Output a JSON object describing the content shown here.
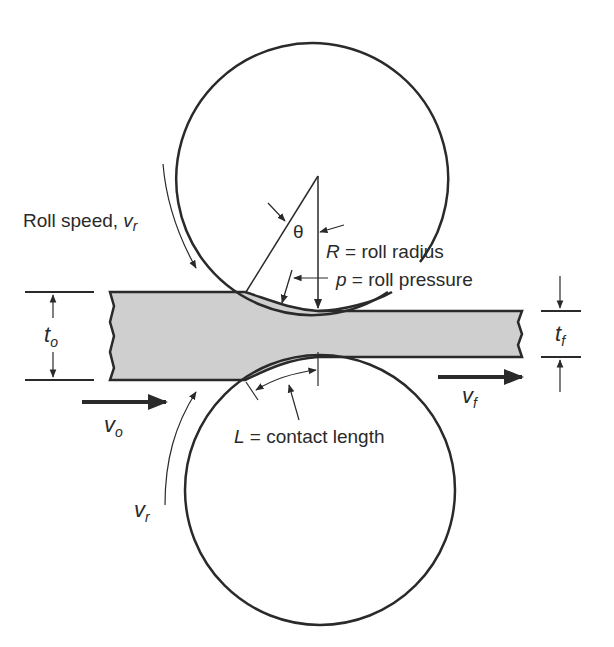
{
  "figure": {
    "colors": {
      "line": "#2a2a2a",
      "sheet_fill": "#cfcfcf",
      "background": "#ffffff"
    }
  },
  "labels": {
    "roll_speed_top": {
      "text": "Roll speed, ",
      "var": "v",
      "sub": "r"
    },
    "theta": {
      "text": "θ"
    },
    "roll_radius": {
      "var": "R",
      "text": " = roll radius"
    },
    "roll_pressure": {
      "var": "p",
      "text": " = roll pressure"
    },
    "entry_thickness": {
      "var": "t",
      "sub": "o"
    },
    "exit_thickness": {
      "var": "t",
      "sub": "f"
    },
    "entry_velocity": {
      "var": "v",
      "sub": "o"
    },
    "exit_velocity": {
      "var": "v",
      "sub": "f"
    },
    "contact_length": {
      "var": "L",
      "text": " = contact length"
    },
    "roll_speed_bottom": {
      "var": "v",
      "sub": "r"
    }
  },
  "geometry": {
    "top_roll": {
      "cx": 318,
      "cy": 176,
      "r": 136
    },
    "bottom_roll": {
      "cx": 320,
      "cy": 490,
      "r": 136
    },
    "sheet_entry": {
      "x_start": 110,
      "top": 292,
      "bottom": 380
    },
    "sheet_exit": {
      "x_end": 522,
      "top": 311,
      "bottom": 357
    }
  }
}
